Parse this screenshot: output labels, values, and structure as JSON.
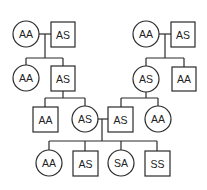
{
  "diagram": {
    "type": "pedigree",
    "generations": [
      {
        "couples": [
          {
            "female": "AA",
            "male": "AS"
          },
          {
            "female": "AA",
            "male": "AS"
          }
        ]
      },
      {
        "left_children": [
          {
            "sex": "female",
            "genotype": "AA"
          },
          {
            "sex": "male",
            "genotype": "AS"
          }
        ],
        "right_children": [
          {
            "sex": "female",
            "genotype": "AS"
          },
          {
            "sex": "male",
            "genotype": "AA"
          }
        ]
      },
      {
        "left_children": [
          {
            "sex": "male",
            "genotype": "AA"
          },
          {
            "sex": "female",
            "genotype": "AS"
          }
        ],
        "right_children": [
          {
            "sex": "male",
            "genotype": "AS"
          },
          {
            "sex": "female",
            "genotype": "AA"
          }
        ]
      },
      {
        "children": [
          {
            "sex": "female",
            "genotype": "AA"
          },
          {
            "sex": "male",
            "genotype": "AS"
          },
          {
            "sex": "female",
            "genotype": "SA"
          },
          {
            "sex": "male",
            "genotype": "SS"
          }
        ]
      }
    ]
  },
  "labels": {
    "g1_left_female": "AA",
    "g1_left_male": "AS",
    "g1_right_female": "AA",
    "g1_right_male": "AS",
    "g2_left_female": "AA",
    "g2_left_male": "AS",
    "g2_right_female": "AS",
    "g2_right_male": "AA",
    "g3_left_male": "AA",
    "g3_left_female": "AS",
    "g3_right_male": "AS",
    "g3_right_female": "AA",
    "g4_child1": "AA",
    "g4_child2": "AS",
    "g4_child3": "SA",
    "g4_child4": "SS"
  }
}
